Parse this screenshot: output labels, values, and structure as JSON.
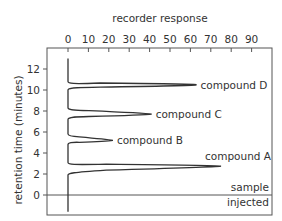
{
  "chart_data": {
    "type": "line",
    "title": "",
    "xlabel": "recorder response",
    "ylabel": "retention time (minutes)",
    "xlim": [
      0,
      100
    ],
    "ylim": [
      -2,
      14
    ],
    "x_ticks": [
      0,
      10,
      20,
      30,
      40,
      50,
      60,
      70,
      80,
      90
    ],
    "y_ticks": [
      0,
      2,
      4,
      6,
      8,
      10,
      12
    ],
    "grid": false,
    "x_axis_position": "top",
    "reference_line": {
      "y": 0,
      "label_above": "sample",
      "label_below": "injected"
    },
    "series": [
      {
        "name": "chromatogram trace",
        "peaks": [
          {
            "label": "compound A",
            "retention_time": 2.75,
            "response": 75,
            "start": 1.9,
            "end": 3.1
          },
          {
            "label": "compound B",
            "retention_time": 5.2,
            "response": 22,
            "start": 4.8,
            "end": 5.8
          },
          {
            "label": "compound C",
            "retention_time": 7.7,
            "response": 41,
            "start": 7.2,
            "end": 8.3
          },
          {
            "label": "compound D",
            "retention_time": 10.5,
            "response": 63,
            "start": 10.0,
            "end": 10.8
          }
        ],
        "baseline": 0,
        "trace_start_time": -1.6,
        "trace_end_time": 13
      }
    ]
  }
}
